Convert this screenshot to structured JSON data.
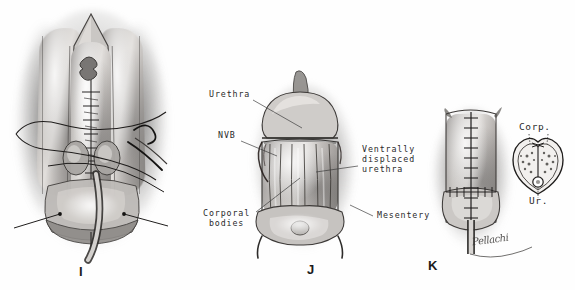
{
  "figure": {
    "background_color": "#ffffff",
    "ink_color": "#2a2a2a",
    "style": "grayscale pencil medical illustration"
  },
  "panels": [
    {
      "letter": "I",
      "name": "panel-i",
      "caption": "",
      "description": "Ventral view of phallus with midline suture line, curved needle with suture thread and traction sutures, urethral catheter exiting distally",
      "labels": []
    },
    {
      "letter": "J",
      "name": "panel-j",
      "caption": "",
      "description": "Glans and corporal bodies with ventrally displaced urethra on mesentery",
      "labels": [
        {
          "text": "Urethra",
          "name": "label-urethra"
        },
        {
          "text": "NVB",
          "name": "label-nvb"
        },
        {
          "text": "Corporal\nbodies",
          "name": "label-corporal-bodies"
        },
        {
          "text": "Ventrally\ndisplaced\nurethra",
          "name": "label-ventrally-displaced-urethra"
        },
        {
          "text": "Mesentery",
          "name": "label-mesentery"
        }
      ]
    },
    {
      "letter": "K",
      "name": "panel-k",
      "caption": "",
      "description": "Completed closure with running midline suture line and catheter in place",
      "labels": []
    }
  ],
  "inset": {
    "name": "cross-section-inset",
    "description": "Heart-shaped transverse cross-section showing paired corporal bodies and ventral urethra",
    "labels": [
      {
        "text": "Corp.",
        "name": "inset-label-corpora"
      },
      {
        "text": "Ur.",
        "name": "inset-label-urethra"
      }
    ]
  },
  "signature": {
    "name": "artist-signature",
    "text": "Pellachi"
  }
}
